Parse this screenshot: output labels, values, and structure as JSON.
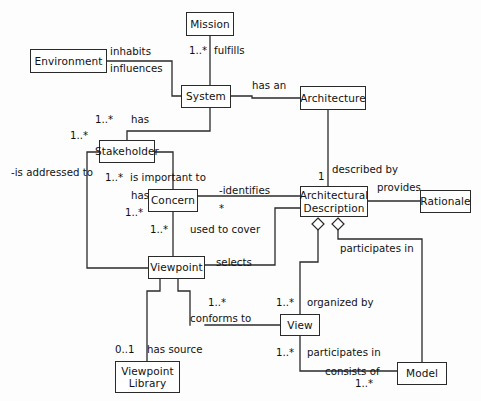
{
  "diagram": {
    "kind": "uml-class-diagram",
    "colors": {
      "stroke": "#2a2a2a",
      "text": "#111111",
      "background": "#fdfdfd",
      "node_fill": "#ffffff"
    },
    "nodes": [
      {
        "id": "mission",
        "label": "Mission",
        "x": 186,
        "y": 12,
        "w": 48,
        "h": 24
      },
      {
        "id": "environment",
        "label": "Environment",
        "x": 30,
        "y": 49,
        "w": 77,
        "h": 24
      },
      {
        "id": "system",
        "label": "System",
        "x": 181,
        "y": 85,
        "w": 50,
        "h": 23
      },
      {
        "id": "architecture",
        "label": "Architecture",
        "x": 300,
        "y": 86,
        "w": 66,
        "h": 24
      },
      {
        "id": "stakeholder",
        "label": "Stakeholder",
        "x": 99,
        "y": 140,
        "w": 56,
        "h": 23
      },
      {
        "id": "concern",
        "label": "Concern",
        "x": 148,
        "y": 189,
        "w": 50,
        "h": 23
      },
      {
        "id": "arch_description",
        "label": "Architectural\nDescription",
        "x": 300,
        "y": 186,
        "w": 68,
        "h": 31
      },
      {
        "id": "rationale",
        "label": "Rationale",
        "x": 420,
        "y": 190,
        "w": 51,
        "h": 23
      },
      {
        "id": "viewpoint",
        "label": "Viewpoint",
        "x": 148,
        "y": 256,
        "w": 57,
        "h": 23
      },
      {
        "id": "view",
        "label": "View",
        "x": 280,
        "y": 314,
        "w": 40,
        "h": 22
      },
      {
        "id": "model",
        "label": "Model",
        "x": 397,
        "y": 362,
        "w": 50,
        "h": 23
      },
      {
        "id": "viewpoint_library",
        "label": "Viewpoint\nLibrary",
        "x": 115,
        "y": 361,
        "w": 65,
        "h": 32
      }
    ],
    "edge_labels": [
      {
        "id": "inhabits",
        "text": "inhabits",
        "x": 110,
        "y": 46
      },
      {
        "id": "fulfills",
        "text": "fulfills",
        "x": 214,
        "y": 45
      },
      {
        "id": "influences",
        "text": "influences",
        "x": 110,
        "y": 63
      },
      {
        "id": "has_an",
        "text": "has an",
        "x": 252,
        "y": 80
      },
      {
        "id": "has_stakeholder",
        "text": "has",
        "x": 131,
        "y": 114
      },
      {
        "id": "described_by",
        "text": "described by",
        "x": 332,
        "y": 164
      },
      {
        "id": "is_addressed_to",
        "text": "-is addressed to",
        "x": 11,
        "y": 167
      },
      {
        "id": "is_important_to",
        "text": "is important to",
        "x": 130,
        "y": 172
      },
      {
        "id": "identifies",
        "text": "-identifies",
        "x": 219,
        "y": 185
      },
      {
        "id": "provides",
        "text": "provides",
        "x": 377,
        "y": 182
      },
      {
        "id": "has_concern",
        "text": "has",
        "x": 131,
        "y": 190
      },
      {
        "id": "used_to_cover",
        "text": "used to cover",
        "x": 190,
        "y": 224
      },
      {
        "id": "participates_in_ad",
        "text": "participates in",
        "x": 340,
        "y": 243
      },
      {
        "id": "selects",
        "text": "selects",
        "x": 216,
        "y": 257
      },
      {
        "id": "organized_by",
        "text": "organized by",
        "x": 307,
        "y": 297
      },
      {
        "id": "conforms_to",
        "text": "conforms to",
        "x": 190,
        "y": 313
      },
      {
        "id": "participates_in_v",
        "text": "participates in",
        "x": 307,
        "y": 347
      },
      {
        "id": "has_source",
        "text": "has source",
        "x": 147,
        "y": 344
      },
      {
        "id": "consists_of",
        "text": "consists of",
        "x": 325,
        "y": 366
      }
    ],
    "multiplicities": [
      {
        "id": "mission_mult",
        "text": "1..*",
        "x": 189,
        "y": 45
      },
      {
        "id": "stakeholder_mult1",
        "text": "1..*",
        "x": 95,
        "y": 114
      },
      {
        "id": "stakeholder_mult2",
        "text": "1..*",
        "x": 70,
        "y": 130
      },
      {
        "id": "concern_mult1",
        "text": "1..*",
        "x": 105,
        "y": 172
      },
      {
        "id": "ad_mult1",
        "text": "1",
        "x": 318,
        "y": 171
      },
      {
        "id": "concern_mult2",
        "text": "1..*",
        "x": 125,
        "y": 207
      },
      {
        "id": "identifies_mult",
        "text": "*",
        "x": 219,
        "y": 203
      },
      {
        "id": "viewpoint_mult1",
        "text": "1..*",
        "x": 150,
        "y": 224
      },
      {
        "id": "view_mult1",
        "text": "1..*",
        "x": 276,
        "y": 297
      },
      {
        "id": "conforms_mult",
        "text": "1..*",
        "x": 208,
        "y": 297
      },
      {
        "id": "view_mult2",
        "text": "1..*",
        "x": 276,
        "y": 347
      },
      {
        "id": "library_mult",
        "text": "0..1",
        "x": 115,
        "y": 344
      },
      {
        "id": "model_mult",
        "text": "1..*",
        "x": 355,
        "y": 378
      }
    ]
  }
}
